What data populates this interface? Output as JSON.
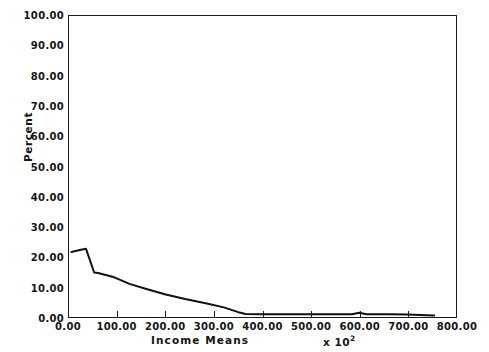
{
  "chart_data": {
    "type": "line",
    "title": "",
    "xlabel": "Income  Means",
    "ylabel": "Percent",
    "x_multiplier_prefix": "x 10",
    "x_multiplier_exponent": "2",
    "xlim": [
      0,
      800
    ],
    "ylim": [
      0,
      100
    ],
    "grid": false,
    "legend": null,
    "x_ticks": [
      0,
      100,
      200,
      300,
      400,
      500,
      600,
      700,
      800
    ],
    "x_tick_labels": [
      "0.00",
      "100.00",
      "200.00",
      "300.00",
      "400.00",
      "500.00",
      "600.00",
      "700.00",
      "800.00"
    ],
    "y_ticks": [
      0,
      10,
      20,
      30,
      40,
      50,
      60,
      70,
      80,
      90,
      100
    ],
    "y_tick_labels": [
      "0.00",
      "10.00",
      "20.00",
      "30.00",
      "40.00",
      "50.00",
      "60.00",
      "70.00",
      "80.00",
      "90.00",
      "100.00"
    ],
    "line_color": "#111111",
    "line_width": 2.0,
    "series": [
      {
        "name": "Percent of population",
        "x": [
          5,
          20,
          35,
          52,
          60,
          90,
          125,
          160,
          200,
          240,
          285,
          320,
          350,
          365,
          400,
          450,
          500,
          550,
          585,
          600,
          615,
          660,
          700,
          725,
          755
        ],
        "values": [
          21.6,
          22.2,
          22.7,
          14.8,
          14.6,
          13.4,
          11.0,
          9.3,
          7.5,
          6.0,
          4.5,
          3.2,
          1.6,
          1.0,
          0.9,
          0.9,
          0.9,
          0.9,
          0.9,
          1.4,
          0.9,
          0.9,
          0.8,
          0.7,
          0.5
        ]
      }
    ]
  }
}
